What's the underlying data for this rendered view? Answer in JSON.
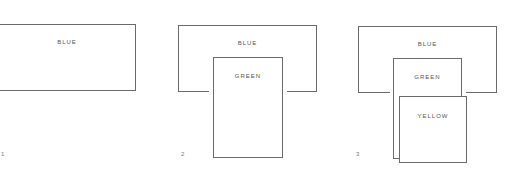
{
  "panels": [
    {
      "number": "1",
      "boxes": [
        {
          "label": "BLUE"
        }
      ]
    },
    {
      "number": "2",
      "boxes": [
        {
          "label": "BLUE"
        },
        {
          "label": "GREEN"
        }
      ]
    },
    {
      "number": "3",
      "boxes": [
        {
          "label": "BLUE"
        },
        {
          "label": "GREEN"
        },
        {
          "label": "YELLOW"
        }
      ]
    }
  ]
}
